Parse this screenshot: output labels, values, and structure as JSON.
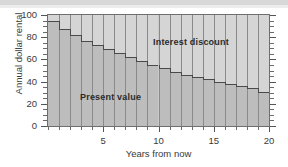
{
  "chart_data": {
    "type": "bar",
    "title": "",
    "subtitle": "",
    "xlabel": "Years from now",
    "ylabel": "Annual dollar rental",
    "xlim": [
      0,
      20
    ],
    "ylim": [
      0,
      100
    ],
    "grid": false,
    "stacked": true,
    "legend_position": "inside-plot-annotations",
    "x_tick_labels": [
      "5",
      "10",
      "15",
      "20"
    ],
    "x_tick_values": [
      5,
      10,
      15,
      20
    ],
    "x_minor_tick_step": 1,
    "y_tick_labels": [
      "0",
      "20",
      "40",
      "60",
      "80",
      "100"
    ],
    "y_tick_values": [
      0,
      20,
      40,
      60,
      80,
      100
    ],
    "y_minor_tick_step": 5,
    "categories": [
      1,
      2,
      3,
      4,
      5,
      6,
      7,
      8,
      9,
      10,
      11,
      12,
      13,
      14,
      15,
      16,
      17,
      18,
      19,
      20
    ],
    "series": [
      {
        "name": "Present value",
        "values": [
          95,
          87,
          82,
          77,
          73,
          69,
          66,
          62,
          59,
          55,
          52,
          49,
          46,
          44,
          42,
          40,
          38,
          36,
          34,
          31
        ]
      },
      {
        "name": "Interest discount",
        "values": [
          5,
          13,
          18,
          23,
          27,
          31,
          34,
          38,
          41,
          45,
          48,
          51,
          54,
          56,
          58,
          60,
          62,
          64,
          66,
          69
        ]
      }
    ],
    "annotations": [
      {
        "text": "Interest discount",
        "x": 12.5,
        "y": 82
      },
      {
        "text": "Present value",
        "x": 4.0,
        "y": 32
      }
    ],
    "colors": {
      "present_value_fill": "#bdbdbd",
      "interest_discount_fill": "#d5d5d5",
      "step_outline": "#4a4a4a",
      "grid_line": "#8a8a8a",
      "frame": "#6e6e6e",
      "text": "#3a3a3a",
      "background": "#ffffff"
    }
  },
  "axes": {
    "y_title": "Annual dollar rental",
    "x_title": "Years from now"
  },
  "labels": {
    "interest_discount": "Interest discount",
    "present_value": "Present value"
  }
}
